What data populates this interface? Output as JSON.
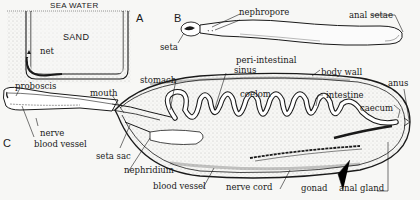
{
  "figure": {
    "panels": [
      {
        "id": "A",
        "label": "A",
        "title": "Burrow in sand"
      },
      {
        "id": "B",
        "label": "B",
        "title": "External view"
      },
      {
        "id": "C",
        "label": "C",
        "title": "Internal anatomy"
      }
    ],
    "panel_a": {
      "sea_water": "SEA WATER",
      "sand": "SAND",
      "net": "net"
    },
    "panel_b": {
      "nephropore": "nephropore",
      "seta": "seta",
      "anal_setae": "anal setae"
    },
    "panel_c": {
      "proboscis": "proboscis",
      "mouth": "mouth",
      "stomach": "stomach",
      "peri_intestinal": "peri-intestinal",
      "sinus": "sinus",
      "body_wall": "body wall",
      "coelom": "coelom",
      "intestine": "intestine",
      "caecum": "caecum",
      "anus": "anus",
      "nerve": "nerve",
      "blood_vessel_proboscis": "blood vessel",
      "seta_sac": "seta sac",
      "nephridium": "nephridium",
      "blood_vessel": "blood vessel",
      "nerve_cord": "nerve cord",
      "gonad": "gonad",
      "anal_gland": "anal gland"
    }
  },
  "colors": {
    "ink": "#1a1a1a",
    "paper": "#f7f7f5",
    "stipple": "#8a8a8a"
  }
}
